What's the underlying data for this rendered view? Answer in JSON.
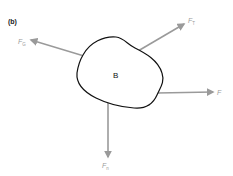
{
  "panel_label": "(b)",
  "body": {
    "label": "B"
  },
  "forces": [
    {
      "id": "gravity",
      "symbol": "F",
      "subscript": "G",
      "direction": "up-left"
    },
    {
      "id": "tension",
      "symbol": "F",
      "subscript": "T",
      "direction": "up-right"
    },
    {
      "id": "applied",
      "symbol": "F",
      "subscript": "",
      "direction": "right"
    },
    {
      "id": "normal",
      "symbol": "F",
      "subscript": "n",
      "direction": "down"
    }
  ],
  "colors": {
    "arrow": "#9a9a9a",
    "outline": "#111111",
    "background": "#ffffff"
  }
}
